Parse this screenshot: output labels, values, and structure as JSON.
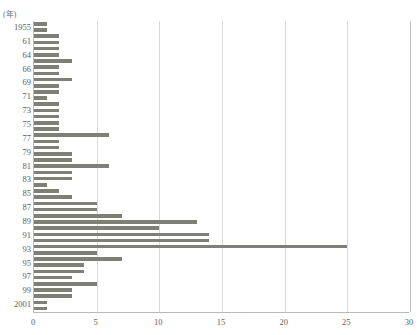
{
  "chart_title": "",
  "axis": {
    "y_unit_label": "(年)",
    "x_ticks": [
      0,
      5,
      10,
      15,
      20,
      25,
      30
    ],
    "x_min": 0,
    "x_max": 30,
    "y_tick_labels": [
      "1955",
      "61",
      "64",
      "66",
      "69",
      "71",
      "73",
      "75",
      "77",
      "79",
      "81",
      "83",
      "85",
      "87",
      "89",
      "91",
      "93",
      "95",
      "97",
      "99",
      "2001"
    ]
  },
  "style": {
    "bar_color": "#7e8076",
    "gridline_color": "#d8d8d8",
    "axis_color": "#b9b9b9",
    "text_color": "#5d5d5d",
    "background": "#ffffff"
  },
  "chart_data": {
    "type": "bar",
    "orientation": "horizontal",
    "title": "",
    "xlabel": "",
    "ylabel": "(年)",
    "xlim": [
      0,
      30
    ],
    "grid": true,
    "legend": "none",
    "categories": [
      "1955",
      "1956",
      "1957",
      "1958",
      "1959",
      "1960",
      "1961",
      "1962",
      "1963",
      "1964",
      "1965",
      "1966",
      "1967",
      "1968",
      "1969",
      "1970",
      "1971",
      "1972",
      "1973",
      "1974",
      "1975",
      "1976",
      "1977",
      "1978",
      "1979",
      "1980",
      "1981",
      "1982",
      "1983",
      "1984",
      "1985",
      "1986",
      "1987",
      "1988",
      "1989",
      "1990",
      "1991",
      "1992",
      "1993",
      "1994",
      "1995",
      "1996",
      "1997",
      "1998",
      "1999",
      "2000",
      "2001"
    ],
    "values": [
      1,
      1,
      2,
      2,
      2,
      2,
      3,
      2,
      2,
      3,
      2,
      2,
      1,
      2,
      2,
      2,
      2,
      2,
      6,
      2,
      2,
      3,
      3,
      6,
      3,
      3,
      1,
      2,
      3,
      5,
      5,
      7,
      13,
      10,
      14,
      14,
      25,
      5,
      7,
      4,
      4,
      3,
      5,
      3,
      3,
      1,
      1
    ],
    "axis_tick_years": [
      "1955",
      "61",
      "64",
      "66",
      "69",
      "71",
      "73",
      "75",
      "77",
      "79",
      "81",
      "83",
      "85",
      "87",
      "89",
      "91",
      "93",
      "95",
      "97",
      "99",
      "2001"
    ]
  }
}
